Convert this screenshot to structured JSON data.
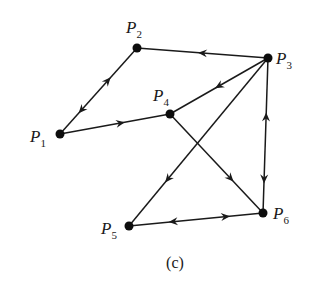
{
  "figure": {
    "caption": "(c)",
    "nodes": [
      {
        "id": "P1",
        "letter": "P",
        "sub": "1",
        "x": 60,
        "y": 134,
        "lx": 30,
        "ly": 142
      },
      {
        "id": "P2",
        "letter": "P",
        "sub": "2",
        "x": 137,
        "y": 48,
        "lx": 126,
        "ly": 33
      },
      {
        "id": "P3",
        "letter": "P",
        "sub": "3",
        "x": 268,
        "y": 58,
        "lx": 276,
        "ly": 64
      },
      {
        "id": "P4",
        "letter": "P",
        "sub": "4",
        "x": 170,
        "y": 114,
        "lx": 153,
        "ly": 101
      },
      {
        "id": "P5",
        "letter": "P",
        "sub": "5",
        "x": 129,
        "y": 226,
        "lx": 101,
        "ly": 234
      },
      {
        "id": "P6",
        "letter": "P",
        "sub": "6",
        "x": 263,
        "y": 213,
        "lx": 273,
        "ly": 219
      }
    ],
    "edges": [
      {
        "from": "P1",
        "to": "P2",
        "arrows": [
          {
            "t": 0.62,
            "dir": "forward"
          },
          {
            "t": 0.28,
            "dir": "backward"
          }
        ]
      },
      {
        "from": "P1",
        "to": "P4",
        "arrows": [
          {
            "t": 0.55,
            "dir": "forward"
          }
        ]
      },
      {
        "from": "P3",
        "to": "P2",
        "arrows": [
          {
            "t": 0.5,
            "dir": "forward"
          }
        ]
      },
      {
        "from": "P3",
        "to": "P4",
        "arrows": [
          {
            "t": 0.5,
            "dir": "forward"
          }
        ]
      },
      {
        "from": "P3",
        "to": "P5",
        "arrows": [
          {
            "t": 0.72,
            "dir": "forward"
          }
        ]
      },
      {
        "from": "P4",
        "to": "P6",
        "arrows": [
          {
            "t": 0.65,
            "dir": "forward"
          }
        ]
      },
      {
        "from": "P6",
        "to": "P3",
        "arrows": [
          {
            "t": 0.62,
            "dir": "forward"
          },
          {
            "t": 0.22,
            "dir": "backward"
          }
        ]
      },
      {
        "from": "P5",
        "to": "P6",
        "arrows": [
          {
            "t": 0.72,
            "dir": "forward"
          },
          {
            "t": 0.33,
            "dir": "backward"
          }
        ]
      }
    ]
  }
}
